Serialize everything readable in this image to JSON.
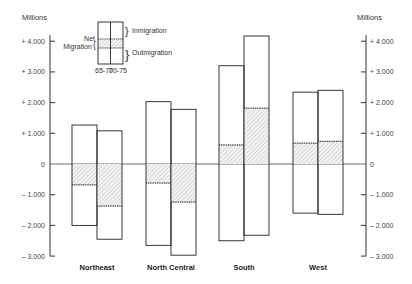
{
  "chart_data": {
    "type": "bar",
    "title": "",
    "ylabel": "Millions",
    "xlabel": "",
    "ylim": [
      -3000,
      4000
    ],
    "y_ticks": [
      4000,
      3000,
      2000,
      1000,
      0,
      -1000,
      -2000,
      -3000
    ],
    "y_tick_labels": [
      "+ 4.000",
      "+ 3.000",
      "+ 2.000",
      "+ 1.000",
      "0",
      "– 1.000",
      "– 2.000",
      "– 3.000"
    ],
    "grid": false,
    "categories": [
      "Northeast",
      "North Central",
      "South",
      "West"
    ],
    "periods": [
      "65-70",
      "70-75"
    ],
    "series": [
      {
        "name": "Inmigration",
        "values": {
          "Northeast": [
            1270,
            1080
          ],
          "North Central": [
            2030,
            1780
          ],
          "South": [
            3200,
            4170
          ],
          "West": [
            2340,
            2400
          ]
        }
      },
      {
        "name": "Outmigration",
        "values": {
          "Northeast": [
            -2000,
            -2450
          ],
          "North Central": [
            -2650,
            -2970
          ],
          "South": [
            -2500,
            -2320
          ],
          "West": [
            -1600,
            -1640
          ]
        }
      },
      {
        "name": "Net Migration",
        "values": {
          "Northeast": [
            -680,
            -1370
          ],
          "North Central": [
            -620,
            -1240
          ],
          "South": [
            620,
            1820
          ],
          "West": [
            680,
            740
          ]
        }
      }
    ],
    "legend": {
      "position": "top-left",
      "labels": {
        "net": [
          "Net",
          "Migration"
        ],
        "in": "Inmigration",
        "out": "Outmigration",
        "periods": [
          "65-70",
          "70-75"
        ]
      }
    }
  },
  "axis": {
    "left_title": "Millions",
    "right_title": "Millions"
  }
}
